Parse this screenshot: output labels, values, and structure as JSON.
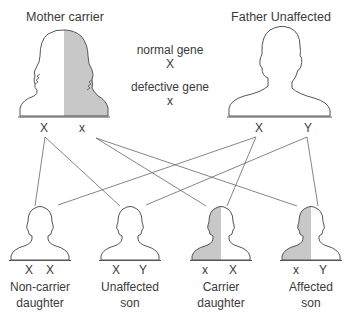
{
  "parents": {
    "mother": {
      "title": "Mother carrier",
      "alleles": [
        "X",
        "x"
      ],
      "status": "carrier"
    },
    "father": {
      "title": "Father Unaffected",
      "alleles": [
        "X",
        "Y"
      ],
      "status": "unaffected"
    }
  },
  "legend": {
    "normal_label": "normal gene",
    "normal_symbol": "X",
    "defective_label": "defective gene",
    "defective_symbol": "x"
  },
  "children": [
    {
      "alleles": [
        "X",
        "X"
      ],
      "name_line1": "Non-carrier",
      "name_line2": "daughter",
      "shaded": false
    },
    {
      "alleles": [
        "X",
        "Y"
      ],
      "name_line1": "Unaffected",
      "name_line2": "son",
      "shaded": false
    },
    {
      "alleles": [
        "x",
        "X"
      ],
      "name_line1": "Carrier",
      "name_line2": "daughter",
      "shaded": true
    },
    {
      "alleles": [
        "x",
        "Y"
      ],
      "name_line1": "Affected",
      "name_line2": "son",
      "shaded": true
    }
  ],
  "inheritance_lines": [
    {
      "from": "mother.X",
      "to": "Non-carrier daughter"
    },
    {
      "from": "mother.X",
      "to": "Unaffected son"
    },
    {
      "from": "mother.x",
      "to": "Carrier daughter"
    },
    {
      "from": "mother.x",
      "to": "Affected son"
    },
    {
      "from": "father.X",
      "to": "Non-carrier daughter"
    },
    {
      "from": "father.X",
      "to": "Carrier daughter"
    },
    {
      "from": "father.Y",
      "to": "Unaffected son"
    },
    {
      "from": "father.Y",
      "to": "Affected son"
    }
  ],
  "colors": {
    "outline": "#555555",
    "shade": "#c8c8c8",
    "line": "#666666",
    "text": "#3a3a3a"
  }
}
